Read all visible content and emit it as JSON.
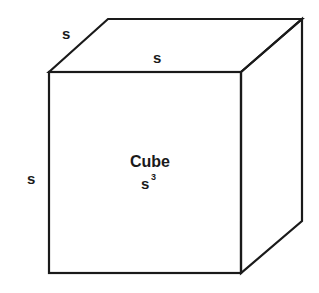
{
  "diagram": {
    "shape": "cube",
    "labels": {
      "edge_depth": "s",
      "edge_top": "s",
      "edge_left": "s",
      "title": "Cube",
      "formula_base": "s",
      "formula_exponent": "3"
    },
    "colors": {
      "stroke": "#1a1a1a",
      "background": "#ffffff"
    }
  }
}
